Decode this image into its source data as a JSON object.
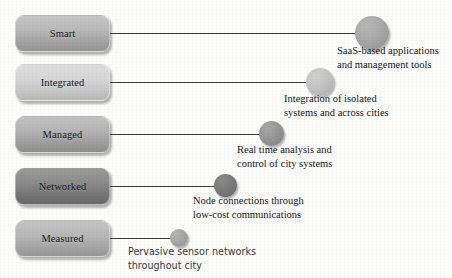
{
  "diagram": {
    "background_color": "#fcfcfb",
    "line_color": "#3a3a3a",
    "rows": [
      {
        "id": "smart",
        "box_label": "Smart",
        "box_shade": "#b2b2b2",
        "circle_shade": "#a4a4a4",
        "caption_line1": "SaaS-based applications",
        "caption_line2": "and management tools",
        "caption_font": "serif"
      },
      {
        "id": "integrated",
        "box_label": "Integrated",
        "box_shade": "#d2d2d2",
        "circle_shade": "#c3c3c3",
        "caption_line1": "Integration of isolated",
        "caption_line2": "systems and across cities",
        "caption_font": "serif"
      },
      {
        "id": "managed",
        "box_label": "Managed",
        "box_shade": "#aeaeae",
        "circle_shade": "#979797",
        "caption_line1": "Real time analysis and",
        "caption_line2": "control of city systems",
        "caption_font": "serif"
      },
      {
        "id": "networked",
        "box_label": "Networked",
        "box_shade": "#848484",
        "circle_shade": "#7b7b7b",
        "caption_line1": "Node connections through",
        "caption_line2": "low-cost communications",
        "caption_font": "serif"
      },
      {
        "id": "measured",
        "box_label": "Measured",
        "box_shade": "#b0b0b0",
        "circle_shade": "#a7a7a7",
        "caption_line1": "Pervasive sensor networks",
        "caption_line2": "throughout city",
        "caption_font": "sans"
      }
    ]
  }
}
